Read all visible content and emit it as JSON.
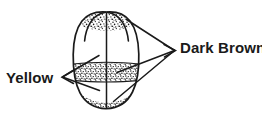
{
  "figure": {
    "background_color": "#ffffff",
    "ink_color": "#1a1a1a",
    "width": 262,
    "height": 117
  },
  "labels": {
    "yellow": {
      "text": "Yellow",
      "position": "left",
      "arrow_glyph": "<",
      "leader_count": 2
    },
    "dark_brown": {
      "text": "Dark Brown",
      "position": "right",
      "arrow_glyph": ">",
      "leader_count": 3
    }
  },
  "subject": {
    "name": "seed",
    "outline": "ovoid seed with two cotyledon lobes at apex and rounded base",
    "midline": "vertical suture line from apex to base",
    "regions": [
      {
        "name": "apex-left-lobe-stipple",
        "color_name": "Dark Brown",
        "color_hex": "#1a1a1a",
        "fill": "stipple"
      },
      {
        "name": "apex-right-lobe-stipple",
        "color_name": "Dark Brown",
        "color_hex": "#1a1a1a",
        "fill": "stipple"
      },
      {
        "name": "upper-body",
        "color_name": "Yellow",
        "color_hex": "#ffffff",
        "fill": "blank"
      },
      {
        "name": "mid-band-stipple",
        "color_name": "Dark Brown",
        "color_hex": "#1a1a1a",
        "fill": "stipple"
      },
      {
        "name": "lower-body",
        "color_name": "Yellow",
        "color_hex": "#ffffff",
        "fill": "blank"
      },
      {
        "name": "base-stipple",
        "color_name": "Dark Brown",
        "color_hex": "#1a1a1a",
        "fill": "stipple"
      }
    ]
  }
}
